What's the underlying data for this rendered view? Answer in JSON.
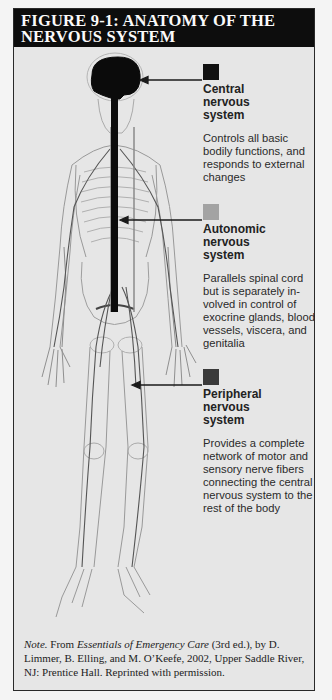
{
  "figure": {
    "title_line1": "FIGURE 9-1: ANATOMY OF THE",
    "title_line2": "NERVOUS SYSTEM",
    "illustration": "human-skeleton-nervous-system-illustration"
  },
  "legend": [
    {
      "name_line1": "Central",
      "name_line2": "nervous",
      "name_line3": "system",
      "swatch_color": "#111111",
      "description": "Controls all basic bodily functions, and responds to external changes"
    },
    {
      "name_line1": "Autonomic",
      "name_line2": "nervous",
      "name_line3": "system",
      "swatch_color": "#a3a3a3",
      "description": "Parallels spinal cord but is separately in-volved in control of exocrine glands, blood vessels, viscera, and genitalia"
    },
    {
      "name_line1": "Peripheral",
      "name_line2": "nervous",
      "name_line3": "system",
      "swatch_color": "#3a3a3a",
      "description": "Provides a complete network of motor and sensory nerve fibers connecting the central nervous system to the rest of the body"
    }
  ],
  "note": {
    "label": "Note.",
    "from": " From ",
    "book_title": "Essentials of Emergency Care",
    "rest": " (3rd ed.), by D. Limmer, B. Elling, and M. O’Keefe, 2002, Upper Saddle River, NJ: Prentice Hall. Reprinted with permission."
  },
  "colors": {
    "title_bg": "#0d0d0d",
    "panel_bg": "#e6e6e6",
    "border": "#2a2a2a"
  }
}
